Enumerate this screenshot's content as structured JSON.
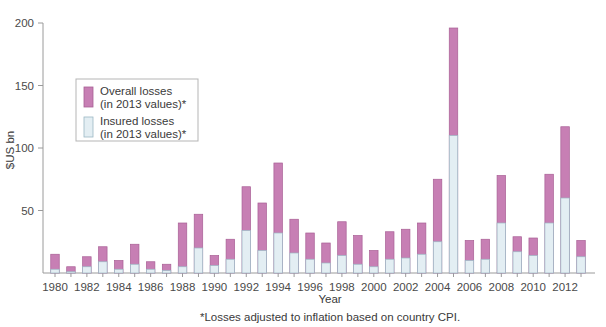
{
  "chart_data": {
    "type": "bar",
    "title": "",
    "xlabel": "Year",
    "ylabel": "$US bn",
    "ylim": [
      0,
      200
    ],
    "yticks": [
      0,
      50,
      100,
      150,
      200
    ],
    "ytick_labels": [
      "",
      "50",
      "100",
      "150",
      "200"
    ],
    "grid": false,
    "stacked": true,
    "legend_position": "upper-left-inside",
    "footnote": "*Losses adjusted to inflation based on country CPI.",
    "categories": [
      1980,
      1981,
      1982,
      1983,
      1984,
      1985,
      1986,
      1987,
      1988,
      1989,
      1990,
      1991,
      1992,
      1993,
      1994,
      1995,
      1996,
      1997,
      1998,
      1999,
      2000,
      2001,
      2002,
      2003,
      2004,
      2005,
      2006,
      2007,
      2008,
      2009,
      2010,
      2011,
      2012,
      2013
    ],
    "xtick_labels": [
      "1980",
      "",
      "1982",
      "",
      "1984",
      "",
      "1986",
      "",
      "1988",
      "",
      "1990",
      "",
      "1992",
      "",
      "1994",
      "",
      "1996",
      "",
      "1998",
      "",
      "2000",
      "",
      "2002",
      "",
      "2004",
      "",
      "2006",
      "",
      "2008",
      "",
      "2010",
      "",
      "2012",
      ""
    ],
    "series": [
      {
        "name": "Insured losses (in 2013 values)*",
        "color": "#e3eef3",
        "edge_color": "#9bb7c4",
        "values": [
          3,
          1,
          5,
          9,
          3,
          7,
          3,
          2,
          5,
          20,
          6,
          11,
          34,
          18,
          32,
          16,
          11,
          8,
          14,
          7,
          5,
          11,
          12,
          15,
          25,
          110,
          10,
          11,
          40,
          17,
          14,
          40,
          60,
          13
        ]
      },
      {
        "name": "Overall losses (in 2013 values)*",
        "color": "#c77fb4",
        "edge_color": "#a85f95",
        "values": [
          15,
          5,
          13,
          21,
          10,
          23,
          9,
          7,
          40,
          47,
          14,
          27,
          69,
          56,
          88,
          43,
          32,
          24,
          41,
          30,
          18,
          33,
          35,
          40,
          75,
          196,
          26,
          27,
          78,
          29,
          28,
          79,
          117,
          26
        ]
      }
    ]
  },
  "legend": {
    "items": [
      {
        "label_line1": "Overall losses",
        "label_line2": "(in 2013 values)*",
        "color": "#c77fb4"
      },
      {
        "label_line1": "Insured losses",
        "label_line2": "(in 2013 values)*",
        "color": "#e3eef3"
      }
    ]
  },
  "axes": {
    "y_title": "$US bn",
    "x_title": "Year"
  },
  "footnote_text": "*Losses adjusted to inflation based on country CPI."
}
